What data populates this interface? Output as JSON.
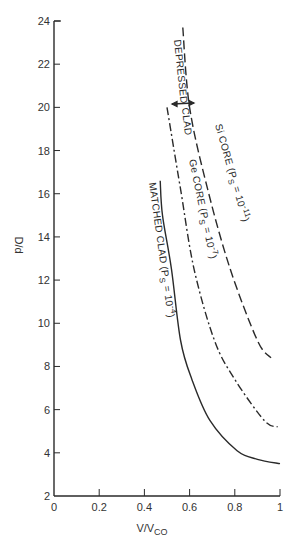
{
  "chart_data": {
    "type": "line",
    "title": "",
    "xlabel": "V/V",
    "xlabel_sub": "CO",
    "ylabel": "D/d",
    "xlim": [
      0,
      1
    ],
    "ylim": [
      2,
      24
    ],
    "grid": false,
    "legend": "inline labels along curves",
    "x_ticks": [
      0,
      0.2,
      0.4,
      0.6,
      0.8,
      1
    ],
    "x_tick_labels": [
      "0",
      "0.2",
      "0.4",
      "0.6",
      "0.8",
      "1"
    ],
    "y_ticks": [
      2,
      4,
      6,
      8,
      10,
      12,
      14,
      16,
      18,
      20,
      22,
      24
    ],
    "y_tick_labels": [
      "2",
      "4",
      "6",
      "8",
      "10",
      "12",
      "14",
      "16",
      "18",
      "20",
      "22",
      "24"
    ],
    "series": [
      {
        "name": "Si CORE (P̄s = 10⁻¹¹)",
        "style": "long-dash",
        "x": [
          0.57,
          0.6,
          0.68,
          0.78,
          0.9,
          0.96
        ],
        "y": [
          23.7,
          20.0,
          16.2,
          12.5,
          9.2,
          8.4
        ]
      },
      {
        "name": "Ge CORE (P̄s = 10⁻⁷)",
        "style": "dash-dot",
        "x": [
          0.5,
          0.56,
          0.62,
          0.71,
          0.8,
          0.93,
          0.99
        ],
        "y": [
          20.0,
          16.2,
          12.5,
          9.2,
          7.4,
          5.5,
          5.2
        ]
      },
      {
        "name": "MATCHED CLAD (P̄s = 10⁻⁴)",
        "style": "solid",
        "x": [
          0.47,
          0.48,
          0.52,
          0.56,
          0.61,
          0.69,
          0.81,
          0.9,
          1.0
        ],
        "y": [
          16.6,
          15.0,
          12.5,
          9.2,
          7.4,
          5.5,
          4.1,
          3.7,
          3.5
        ]
      }
    ],
    "annotations": [
      {
        "text": "DEPRESSED",
        "note": "bracket spanning between Ge and Si curves at D/d ≈ 20"
      },
      {
        "text": "CLAD"
      }
    ]
  },
  "labels": {
    "si": {
      "main": "Si CORE  (P",
      "sub": "S",
      "eq": " = 10",
      "sup": "-11",
      "close": ")"
    },
    "ge": {
      "main": "Ge CORE  (P",
      "sub": "S",
      "eq": " = 10",
      "sup": "-7",
      "close": ")"
    },
    "matched": {
      "main": "MATCHED CLAD  (P",
      "sub": "S",
      "eq": " = 10",
      "sup": "-4",
      "close": ")"
    },
    "depressed": "DEPRESSED",
    "clad": "CLAD"
  }
}
